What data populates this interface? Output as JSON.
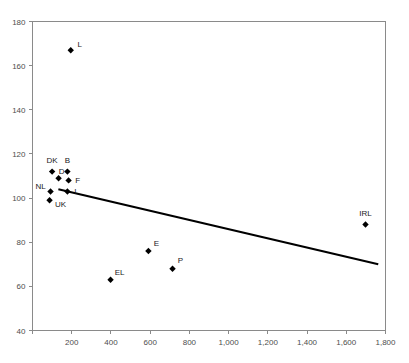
{
  "chart_data": {
    "type": "scatter",
    "title": "",
    "subtitle": "",
    "xlabel": "",
    "ylabel": "",
    "xlim": [
      0,
      1800
    ],
    "ylim": [
      40,
      180
    ],
    "xticks": [
      0,
      200,
      400,
      600,
      800,
      1000,
      1200,
      1400,
      1600,
      1800
    ],
    "xtick_labels": [
      "",
      "200",
      "400",
      "600",
      "800",
      "1,000",
      "1,200",
      "1,400",
      "1,600",
      "1,800"
    ],
    "yticks": [
      40,
      60,
      80,
      100,
      120,
      140,
      160,
      180
    ],
    "ytick_labels": [
      "40",
      "60",
      "80",
      "100",
      "120",
      "140",
      "160",
      "180"
    ],
    "grid": false,
    "legend": false,
    "marker_shape": "diamond",
    "marker_color": "#000000",
    "points": [
      {
        "label": "L",
        "x": 195,
        "y": 167,
        "label_dx": 9,
        "label_dy": -3
      },
      {
        "label": "DK",
        "x": 100,
        "y": 112,
        "label_dx": 0,
        "label_dy": -9
      },
      {
        "label": "B",
        "x": 178,
        "y": 112,
        "label_dx": 0,
        "label_dy": -9
      },
      {
        "label": "D",
        "x": 133,
        "y": 109,
        "label_dx": 3,
        "label_dy": -4
      },
      {
        "label": "F",
        "x": 184,
        "y": 108,
        "label_dx": 9,
        "label_dy": 3
      },
      {
        "label": "NL",
        "x": 92,
        "y": 103,
        "label_dx": -10,
        "label_dy": -2
      },
      {
        "label": "I",
        "x": 178,
        "y": 103,
        "label_dx": 8,
        "label_dy": 3
      },
      {
        "label": "UK",
        "x": 87,
        "y": 99,
        "label_dx": 11,
        "label_dy": 7
      },
      {
        "label": "EL",
        "x": 398,
        "y": 63,
        "label_dx": 9,
        "label_dy": -5
      },
      {
        "label": "E",
        "x": 591,
        "y": 76,
        "label_dx": 8,
        "label_dy": -5
      },
      {
        "label": "P",
        "x": 714,
        "y": 68,
        "label_dx": 8,
        "label_dy": -6
      },
      {
        "label": "IRL",
        "x": 1698,
        "y": 88,
        "label_dx": 0,
        "label_dy": -9
      }
    ],
    "trendline": {
      "type": "linear",
      "x0": 132,
      "y0": 104,
      "x1": 1763,
      "y1": 70,
      "color": "#000000"
    }
  },
  "axis": {
    "line_color": "#8a8a8a",
    "label_color": "#4d4d4d"
  }
}
